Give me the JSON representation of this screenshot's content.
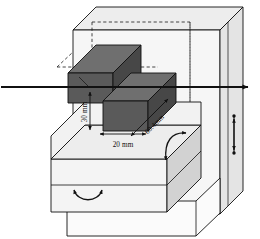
{
  "figure": {
    "type": "technical-line-diagram",
    "background_color": "#ffffff",
    "line_color": "#111111"
  },
  "dimensions": {
    "height_label": "30 mm",
    "width_label": "20 mm",
    "length_label": "60.4mm"
  },
  "colors": {
    "block_top": "#6f6f6f",
    "block_front": "#5a5a5a",
    "block_side": "#474747",
    "enclosure_face": "#f2f2f2",
    "enclosure_side": "#e4e4e4",
    "enclosure_top": "#ededed",
    "stage_top": "#ededed",
    "stage_front": "#f4f4f4",
    "stage_side": "#d2d2d2",
    "outline": "#111111",
    "hidden_line": "#222222"
  },
  "annotations": {
    "beam_axis": "horizontal beam axis arrow",
    "tilt_rotation": "curved double headed rotation arrow on stage side face",
    "base_rotation": "curved double headed rotation arrow on base front face",
    "vertical_translation": "vertical double headed translation arrow on right panel"
  },
  "elements": {
    "enclosure": "transparent outer enclosure box",
    "hidden_edges": "dashed hidden construction lines",
    "block_upper": "upper dark specimen block",
    "block_lower": "lower dark specimen block",
    "stage_upper": "upper stage slab",
    "stage_lower": "lower stage slab",
    "base_plate": "bottom base plate"
  }
}
